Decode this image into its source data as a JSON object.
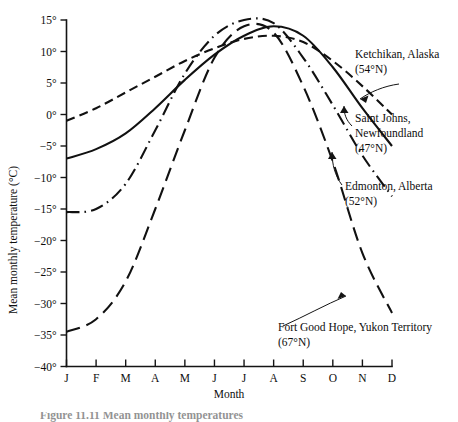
{
  "figure": {
    "caption_fragment": "Figure  11.11   Mean monthly temperatures"
  },
  "axes": {
    "y_title": "Mean monthly temperature (°C)",
    "x_title": "Month",
    "y_ticks": [
      "15°",
      "10°",
      "5°",
      "0°",
      "−5°",
      "−10°",
      "−15°",
      "−20°",
      "−25°",
      "−30°",
      "−35°",
      "−40°"
    ],
    "x_ticks": [
      "J",
      "F",
      "M",
      "A",
      "M",
      "J",
      "J",
      "A",
      "S",
      "O",
      "N",
      "D"
    ]
  },
  "annotations": [
    {
      "id": "ketchikan",
      "line1": "Ketchikan, Alaska",
      "line2": "(54°N)"
    },
    {
      "id": "saint-johns",
      "line1": "Saint Johns,",
      "line2": "Newfoundland",
      "line3": "(47°N)"
    },
    {
      "id": "edmonton",
      "line1": "Edmonton, Alberta",
      "line2": "(52°N)"
    },
    {
      "id": "fort-good-hope",
      "line1": "Fort Good Hope, Yukon Territory",
      "line2": "(67°N)"
    }
  ],
  "chart_data": {
    "type": "line",
    "title": "",
    "xlabel": "Month",
    "ylabel": "Mean monthly temperature (°C)",
    "categories": [
      "J",
      "F",
      "M",
      "A",
      "M",
      "J",
      "J",
      "A",
      "S",
      "O",
      "N",
      "D"
    ],
    "ylim": [
      -40,
      15
    ],
    "ytick_step": 5,
    "grid": false,
    "legend": "annotated-on-plot",
    "series": [
      {
        "name": "Ketchikan, Alaska (54°N)",
        "latitude": "54°N",
        "style": "solid",
        "values": [
          -7.0,
          -5.5,
          -3.0,
          1.0,
          5.5,
          9.5,
          12.5,
          14.0,
          12.5,
          7.5,
          1.0,
          -5.0
        ]
      },
      {
        "name": "Saint Johns, Newfoundland (47°N)",
        "latitude": "47°N",
        "style": "short-dash",
        "values": [
          -1.0,
          1.0,
          3.5,
          6.0,
          8.5,
          10.5,
          12.0,
          12.5,
          11.5,
          8.5,
          4.5,
          0.0
        ]
      },
      {
        "name": "Edmonton, Alberta (52°N)",
        "latitude": "52°N",
        "style": "dash-dot",
        "values": [
          -15.5,
          -15.0,
          -11.0,
          -2.5,
          6.5,
          12.5,
          15.0,
          14.5,
          9.0,
          1.5,
          -6.5,
          -13.0
        ]
      },
      {
        "name": "Fort Good Hope, Yukon Territory (67°N)",
        "latitude": "67°N",
        "style": "long-dash",
        "values": [
          -34.5,
          -32.5,
          -26.5,
          -15.0,
          -2.5,
          9.0,
          14.0,
          13.0,
          4.5,
          -7.5,
          -22.0,
          -31.5
        ]
      }
    ]
  }
}
